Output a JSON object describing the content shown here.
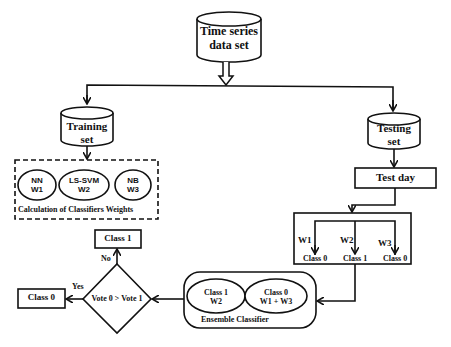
{
  "diagram": {
    "source": {
      "label_line1": "Time series",
      "label_line2": "data set"
    },
    "training": {
      "label_line1": "Training",
      "label_line2": "set"
    },
    "testing": {
      "label_line1": "Testing",
      "label_line2": "set"
    },
    "test_day": {
      "label": "Test day"
    },
    "classifiers": [
      {
        "name": "NN",
        "weight": "W1"
      },
      {
        "name": "LS-SVM",
        "weight": "W2"
      },
      {
        "name": "NB",
        "weight": "W3"
      }
    ],
    "weights_caption": "Calculation of Classifiers Weights",
    "predictions": [
      {
        "weight": "W1",
        "class": "Class 0"
      },
      {
        "weight": "W2",
        "class": "Class 1"
      },
      {
        "weight": "W3",
        "class": "Class 0"
      }
    ],
    "ensemble": {
      "caption": "Ensemble Classifier",
      "left": {
        "line1": "Class 1",
        "line2": "W2"
      },
      "right": {
        "line1": "Class 0",
        "line2": "W1 + W3"
      }
    },
    "decision": {
      "label": "Vote 0 > Vote 1",
      "yes": "Yes",
      "no": "No"
    },
    "outcome_yes": "Class 0",
    "outcome_no": "Class 1"
  }
}
